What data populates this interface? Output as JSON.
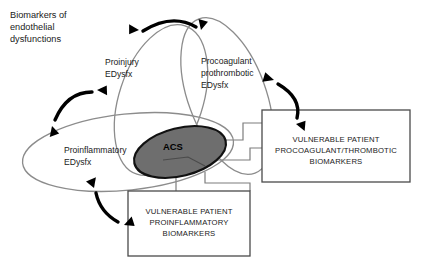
{
  "figure": {
    "caption": {
      "line1": "Biomarkers of",
      "line2": "endothelial",
      "line3": "dysfunctions"
    },
    "domains": [
      {
        "id": "proinjury",
        "line1": "Proinjury",
        "line2": "EDysfx",
        "shape": "ellipse",
        "outline_color": "#8c8c8c"
      },
      {
        "id": "procoagulant",
        "line1": "Procoagulant",
        "line2": "prothrombotic",
        "line3": "EDysfx",
        "shape": "ellipse",
        "outline_color": "#8c8c8c"
      },
      {
        "id": "proinflammatory",
        "line1": "Proinflammatory",
        "line2": "EDysfx",
        "shape": "ellipse",
        "outline_color": "#8c8c8c"
      }
    ],
    "center": {
      "label": "ACS",
      "fill_color": "#6e6e6e",
      "stroke_color": "#111111"
    },
    "boxes": [
      {
        "id": "procoagulant-biomarkers",
        "line1": "VULNERABLE PATIENT",
        "line2": "PROCOAGULANT/THROMBOTIC",
        "line3": "BIOMARKERS",
        "border_color": "#4a4a4a"
      },
      {
        "id": "proinflammatory-biomarkers",
        "line1": "VULNERABLE PATIENT",
        "line2": "PROINFLAMMATORY",
        "line3": "BIOMARKERS",
        "border_color": "#4a4a4a"
      }
    ],
    "arrows": [
      {
        "id": "proinjury-procoagulant",
        "style": "double-headed-curved",
        "color": "#000000"
      },
      {
        "id": "caption-proinjury",
        "style": "double-headed-curved",
        "color": "#000000"
      },
      {
        "id": "procoagulant-to-box",
        "style": "double-headed-curved",
        "color": "#000000"
      },
      {
        "id": "proinflammatory-to-box",
        "style": "double-headed-curved",
        "color": "#000000"
      }
    ]
  }
}
